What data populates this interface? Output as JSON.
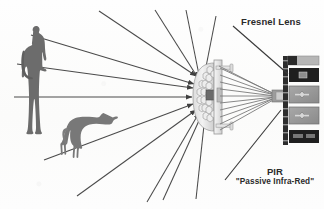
{
  "figure": {
    "title_visible": false,
    "background_color": "#fdfdfc",
    "ink_color": "#3b3b3b",
    "labels": {
      "fresnel_lens": "Fresnel Lens",
      "pir_acronym": "PIR",
      "pir_expansion": "\"Passive Infra-Red\""
    },
    "subjects": {
      "human": {
        "name": "human-silhouette",
        "fill": "#6e6e6e"
      },
      "dog": {
        "name": "dog-silhouette",
        "fill": "#787878"
      }
    },
    "fresnel_lens": {
      "name": "fresnel-lens-dome",
      "facet_count": 19,
      "facet_shape": "hexagon",
      "body_fill": "#e9e9e9",
      "outline": "#8a8a8a"
    },
    "pir_board": {
      "name": "pir-sensor-board",
      "rail_fill": "#2d2d2d",
      "components": [
        {
          "label": "",
          "kind": "gray-bar",
          "fill": "#b4b4b4"
        },
        {
          "label": "",
          "kind": "dark-chip",
          "fill": "#222222"
        },
        {
          "label": "",
          "kind": "gray-chip-cross",
          "fill": "#9a9a9a"
        },
        {
          "label": "",
          "kind": "gray-chip-cross",
          "fill": "#9a9a9a"
        },
        {
          "label": "",
          "kind": "dark-chip",
          "fill": "#222222"
        }
      ]
    },
    "incoming_rays": {
      "name": "incoming-infrared-rays",
      "count": 13,
      "direction": "toward-lens",
      "arrowheads": true,
      "stroke": "#4a4a4a"
    },
    "focused_rays": {
      "name": "focused-rays",
      "count": 9,
      "direction": "lens-to-sensor",
      "stroke": "#6a6a6a"
    },
    "leader_lines": [
      {
        "name": "fresnel-leader-line",
        "from": "fresnel-label",
        "to": "lens"
      },
      {
        "name": "pir-leader-line",
        "from": "pir-label",
        "to": "sensor"
      }
    ]
  }
}
